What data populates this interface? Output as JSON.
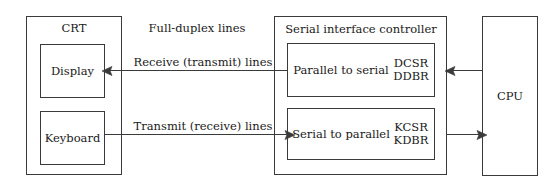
{
  "diagram": {
    "stroke_color": "#3a3a3a",
    "background_color": "#ffffff",
    "text_color": "#1a1a1a"
  },
  "terminal": {
    "title": "CRT",
    "display_label": "Display",
    "keyboard_label": "Keyboard"
  },
  "controller": {
    "title": "Serial interface controller",
    "parallel_to_serial_label": "Parallel to serial",
    "parallel_to_serial_registers": "DCSR\nDDBR",
    "serial_to_parallel_label": "Serial to parallel",
    "serial_to_parallel_registers": "KCSR\nKDBR"
  },
  "cpu": {
    "label": "CPU"
  },
  "connections": {
    "full_duplex_label": "Full-duplex lines",
    "receive_line_label": "Receive (transmit) lines",
    "transmit_line_label": "Transmit (receive) lines"
  }
}
